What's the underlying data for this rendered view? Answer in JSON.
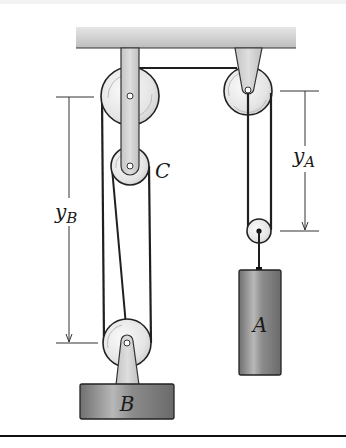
{
  "figure": {
    "type": "pulley-system",
    "labels": {
      "pulley_c": "C",
      "block_a": "A",
      "block_b": "B",
      "dim_a_main": "y",
      "dim_a_sub": "A",
      "dim_b_main": "y",
      "dim_b_sub": "B"
    },
    "colors": {
      "ceiling": "#c9c9c9",
      "bracket": "#d2d2d2",
      "pulley": "#ececec",
      "rope": "#1f1f1f",
      "block": "#8a8a8a",
      "dimension": "#333333",
      "rule": "#111111"
    }
  }
}
